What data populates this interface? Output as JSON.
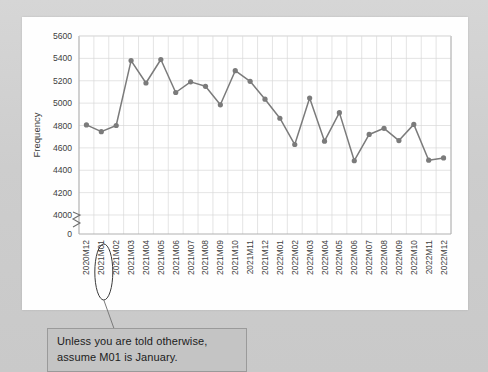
{
  "chart_data": {
    "type": "line",
    "title": "",
    "xlabel": "",
    "ylabel": "Frequency",
    "ylim": [
      3900,
      5600
    ],
    "yticks": [
      0,
      4000,
      4200,
      4400,
      4600,
      4800,
      5000,
      5200,
      5400,
      5600
    ],
    "ytick_labels": [
      "0",
      "4000",
      "4200",
      "4400",
      "4600",
      "4800",
      "5000",
      "5200",
      "5400",
      "5600"
    ],
    "axis_break": true,
    "grid": true,
    "legend": "none",
    "series_color": "#7b7b7b",
    "marker": "circle",
    "categories": [
      "2020M12",
      "2021M01",
      "2021M02",
      "2021M03",
      "2021M04",
      "2021M05",
      "2021M06",
      "2021M07",
      "2021M08",
      "2021M09",
      "2021M10",
      "2021M11",
      "2021M12",
      "2022M01",
      "2022M02",
      "2022M03",
      "2022M04",
      "2022M05",
      "2022M06",
      "2022M07",
      "2022M08",
      "2022M09",
      "2022M10",
      "2022M11",
      "2022M12"
    ],
    "values": [
      4805,
      4745,
      4800,
      5380,
      5180,
      5390,
      5095,
      5190,
      5150,
      4985,
      5290,
      5195,
      5035,
      4865,
      4630,
      5045,
      4660,
      4915,
      4485,
      4720,
      4775,
      4665,
      4810,
      4490,
      4510
    ]
  },
  "annotation": {
    "line1": "Unless you are told otherwise,",
    "line2": "assume M01 is January.",
    "highlighted_category": "2021M01"
  },
  "colors": {
    "background": "#d2d2d2",
    "panel": "#fefefe",
    "series": "#7b7b7b",
    "grid": "#d8d8d8",
    "axis": "#b0b0b0",
    "text": "#404040",
    "annotation_bg": "#c4c4c4",
    "annotation_border": "#9a9a9a"
  }
}
